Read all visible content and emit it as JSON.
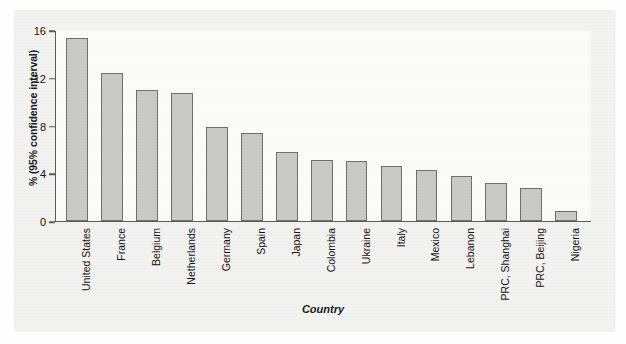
{
  "chart_data": {
    "type": "bar",
    "title": "",
    "xlabel": "Country",
    "ylabel": "% (95% confidence interval)",
    "ylim": [
      0,
      16
    ],
    "yticks": [
      0,
      4,
      8,
      12,
      16
    ],
    "grid": false,
    "legend": null,
    "bar_color": "#c9c9c7",
    "bar_border_color": "#6e6e6e",
    "axis_color": "#5b5b5b",
    "plot_background": "#fbfbfa",
    "figure_background": "#f2f2f1",
    "categories": [
      "United States",
      "France",
      "Belgium",
      "Netherlands",
      "Germany",
      "Spain",
      "Japan",
      "Colombia",
      "Ukraine",
      "Italy",
      "Mexico",
      "Lebanon",
      "PRC, Shanghai",
      "PRC, Beijing",
      "Nigeria"
    ],
    "values": [
      15.3,
      12.4,
      11.0,
      10.7,
      7.9,
      7.4,
      5.8,
      5.1,
      5.0,
      4.6,
      4.3,
      3.8,
      3.2,
      2.8,
      0.8
    ]
  }
}
